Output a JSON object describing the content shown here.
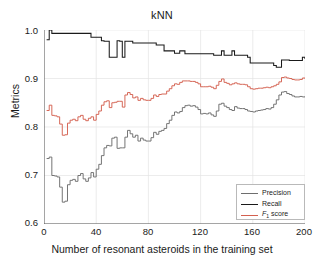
{
  "chart_data": {
    "type": "line",
    "title": "kNN",
    "xlabel": "Number of resonant asteroids in the training set",
    "ylabel": "Metrics",
    "xlim": [
      0,
      200
    ],
    "ylim": [
      0.6,
      1.0
    ],
    "xticks": [
      0,
      40,
      80,
      120,
      160,
      200
    ],
    "yticks": [
      "0.6",
      "0.7",
      "0.8",
      "0.9",
      "1.0"
    ],
    "grid": true,
    "legend_position": "lower right",
    "colors": {
      "precision": "#6e6e6e",
      "recall": "#1a1a1a",
      "f1": "#d4604f"
    },
    "series": [
      {
        "name": "Precision",
        "color": "#6e6e6e",
        "x": [
          2,
          4,
          6,
          8,
          10,
          12,
          14,
          16,
          18,
          20,
          22,
          24,
          26,
          28,
          30,
          32,
          34,
          36,
          38,
          40,
          42,
          44,
          46,
          48,
          50,
          52,
          54,
          56,
          58,
          60,
          62,
          64,
          66,
          68,
          70,
          72,
          74,
          76,
          78,
          80,
          82,
          84,
          86,
          88,
          90,
          92,
          94,
          96,
          98,
          100,
          102,
          104,
          106,
          108,
          110,
          112,
          114,
          116,
          118,
          120,
          122,
          124,
          126,
          128,
          130,
          132,
          134,
          136,
          138,
          140,
          142,
          144,
          146,
          148,
          150,
          152,
          154,
          156,
          158,
          160,
          162,
          164,
          166,
          168,
          170,
          172,
          174,
          176,
          178,
          180,
          182,
          184,
          186,
          188,
          190,
          192,
          194,
          196,
          198,
          200
        ],
        "values": [
          0.735,
          0.738,
          0.7,
          0.699,
          0.697,
          0.676,
          0.645,
          0.647,
          0.681,
          0.69,
          0.692,
          0.688,
          0.7,
          0.704,
          0.693,
          0.688,
          0.695,
          0.706,
          0.697,
          0.713,
          0.723,
          0.741,
          0.757,
          0.762,
          0.761,
          0.777,
          0.779,
          0.756,
          0.757,
          0.757,
          0.779,
          0.793,
          0.786,
          0.779,
          0.783,
          0.771,
          0.777,
          0.773,
          0.771,
          0.771,
          0.778,
          0.789,
          0.785,
          0.791,
          0.793,
          0.797,
          0.807,
          0.814,
          0.824,
          0.831,
          0.829,
          0.832,
          0.84,
          0.844,
          0.845,
          0.843,
          0.844,
          0.841,
          0.836,
          0.827,
          0.828,
          0.827,
          0.829,
          0.825,
          0.822,
          0.833,
          0.847,
          0.849,
          0.843,
          0.84,
          0.836,
          0.834,
          0.842,
          0.839,
          0.838,
          0.838,
          0.836,
          0.833,
          0.832,
          0.831,
          0.833,
          0.834,
          0.835,
          0.836,
          0.838,
          0.837,
          0.84,
          0.847,
          0.856,
          0.866,
          0.872,
          0.873,
          0.869,
          0.867,
          0.864,
          0.862,
          0.862,
          0.863,
          0.862,
          0.863
        ]
      },
      {
        "name": "Recall",
        "color": "#1a1a1a",
        "x": [
          2,
          4,
          6,
          8,
          10,
          12,
          14,
          16,
          18,
          20,
          22,
          24,
          26,
          28,
          30,
          32,
          34,
          36,
          38,
          40,
          42,
          44,
          46,
          48,
          50,
          52,
          54,
          56,
          58,
          60,
          62,
          64,
          66,
          68,
          70,
          72,
          74,
          76,
          78,
          80,
          82,
          84,
          86,
          88,
          90,
          92,
          94,
          96,
          98,
          100,
          102,
          104,
          106,
          108,
          110,
          112,
          114,
          116,
          118,
          120,
          122,
          124,
          126,
          128,
          130,
          132,
          134,
          136,
          138,
          140,
          142,
          144,
          146,
          148,
          150,
          152,
          154,
          156,
          158,
          160,
          162,
          164,
          166,
          168,
          170,
          172,
          174,
          176,
          178,
          180,
          182,
          184,
          186,
          188,
          190,
          192,
          194,
          196,
          198,
          200
        ],
        "values": [
          0.98,
          1.0,
          0.993,
          0.993,
          0.993,
          0.993,
          0.993,
          0.993,
          0.993,
          0.993,
          0.993,
          0.993,
          0.993,
          0.993,
          0.993,
          0.993,
          0.993,
          0.985,
          0.985,
          0.985,
          0.985,
          0.978,
          0.977,
          0.977,
          0.944,
          0.944,
          0.944,
          0.978,
          0.977,
          0.944,
          0.977,
          0.977,
          0.977,
          0.973,
          0.973,
          0.973,
          0.973,
          0.973,
          0.973,
          0.973,
          0.973,
          0.973,
          0.969,
          0.969,
          0.969,
          0.957,
          0.957,
          0.957,
          0.957,
          0.952,
          0.952,
          0.957,
          0.957,
          0.951,
          0.951,
          0.951,
          0.951,
          0.951,
          0.951,
          0.951,
          0.951,
          0.951,
          0.951,
          0.951,
          0.948,
          0.948,
          0.948,
          0.957,
          0.948,
          0.948,
          0.948,
          0.957,
          0.948,
          0.948,
          0.948,
          0.948,
          0.948,
          0.944,
          0.932,
          0.932,
          0.932,
          0.932,
          0.932,
          0.932,
          0.932,
          0.932,
          0.932,
          0.927,
          0.923,
          0.923,
          0.938,
          0.938,
          0.938,
          0.937,
          0.937,
          0.937,
          0.937,
          0.937,
          0.944,
          0.94
        ]
      },
      {
        "name": "F1 score",
        "color": "#d4604f",
        "x": [
          2,
          4,
          6,
          8,
          10,
          12,
          14,
          16,
          18,
          20,
          22,
          24,
          26,
          28,
          30,
          32,
          34,
          36,
          38,
          40,
          42,
          44,
          46,
          48,
          50,
          52,
          54,
          56,
          58,
          60,
          62,
          64,
          66,
          68,
          70,
          72,
          74,
          76,
          78,
          80,
          82,
          84,
          86,
          88,
          90,
          92,
          94,
          96,
          98,
          100,
          102,
          104,
          106,
          108,
          110,
          112,
          114,
          116,
          118,
          120,
          122,
          124,
          126,
          128,
          130,
          132,
          134,
          136,
          138,
          140,
          142,
          144,
          146,
          148,
          150,
          152,
          154,
          156,
          158,
          160,
          162,
          164,
          166,
          168,
          170,
          172,
          174,
          176,
          178,
          180,
          182,
          184,
          186,
          188,
          190,
          192,
          194,
          196,
          198,
          200
        ],
        "values": [
          0.834,
          0.845,
          0.824,
          0.823,
          0.821,
          0.806,
          0.783,
          0.784,
          0.808,
          0.814,
          0.816,
          0.813,
          0.821,
          0.824,
          0.816,
          0.813,
          0.818,
          0.821,
          0.814,
          0.826,
          0.833,
          0.845,
          0.852,
          0.854,
          0.84,
          0.85,
          0.851,
          0.853,
          0.853,
          0.841,
          0.866,
          0.871,
          0.867,
          0.86,
          0.862,
          0.855,
          0.859,
          0.856,
          0.855,
          0.855,
          0.859,
          0.866,
          0.863,
          0.867,
          0.868,
          0.868,
          0.874,
          0.879,
          0.885,
          0.889,
          0.888,
          0.892,
          0.895,
          0.895,
          0.895,
          0.894,
          0.894,
          0.892,
          0.889,
          0.883,
          0.883,
          0.883,
          0.884,
          0.882,
          0.879,
          0.886,
          0.894,
          0.899,
          0.892,
          0.89,
          0.887,
          0.889,
          0.891,
          0.889,
          0.888,
          0.888,
          0.887,
          0.883,
          0.879,
          0.878,
          0.879,
          0.88,
          0.88,
          0.881,
          0.882,
          0.881,
          0.883,
          0.885,
          0.888,
          0.893,
          0.902,
          0.903,
          0.901,
          0.9,
          0.898,
          0.897,
          0.897,
          0.898,
          0.901,
          0.9
        ]
      }
    ]
  },
  "legend": {
    "items": [
      {
        "label": "Precision",
        "color": "#6e6e6e"
      },
      {
        "label": "Recall",
        "color": "#1a1a1a"
      },
      {
        "label": "F",
        "sub": "1",
        "label_tail": " score",
        "color": "#d4604f"
      }
    ]
  }
}
